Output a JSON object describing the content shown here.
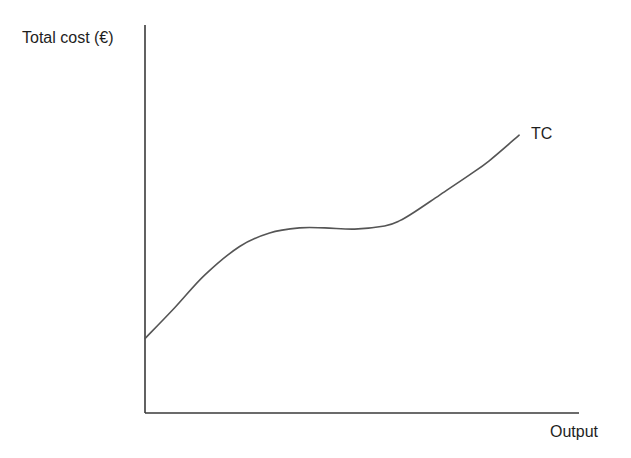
{
  "chart_data": {
    "type": "line",
    "title": "",
    "xlabel": "Output",
    "ylabel": "Total cost (€)",
    "grid": false,
    "legend": "none",
    "x_ticks": [],
    "y_ticks": [],
    "axis_ranges": {
      "x": [
        0,
        100
      ],
      "y": [
        0,
        100
      ]
    },
    "series": [
      {
        "name": "TC",
        "label_position": "end-of-line",
        "color": "#555555",
        "points_normalized": [
          {
            "x": 0.0,
            "y": 19.2
          },
          {
            "x": 6.9,
            "y": 27.2
          },
          {
            "x": 13.8,
            "y": 35.6
          },
          {
            "x": 21.8,
            "y": 42.9
          },
          {
            "x": 28.7,
            "y": 46.4
          },
          {
            "x": 35.6,
            "y": 47.7
          },
          {
            "x": 41.4,
            "y": 47.7
          },
          {
            "x": 48.3,
            "y": 47.4
          },
          {
            "x": 55.2,
            "y": 48.2
          },
          {
            "x": 58.6,
            "y": 49.5
          },
          {
            "x": 62.1,
            "y": 51.8
          },
          {
            "x": 67.8,
            "y": 56.1
          },
          {
            "x": 74.7,
            "y": 61.3
          },
          {
            "x": 79.3,
            "y": 65.0
          },
          {
            "x": 86.2,
            "y": 71.6
          }
        ]
      }
    ],
    "annotations": [
      {
        "text": "TC",
        "anchor": "end of curve, upper right"
      }
    ]
  },
  "labels": {
    "y_axis": "Total cost (€)",
    "x_axis": "Output",
    "series": "TC"
  },
  "colors": {
    "axis": "#3a3a3a",
    "curve": "#555555",
    "text": "#1e1e1e",
    "background": "#ffffff"
  }
}
